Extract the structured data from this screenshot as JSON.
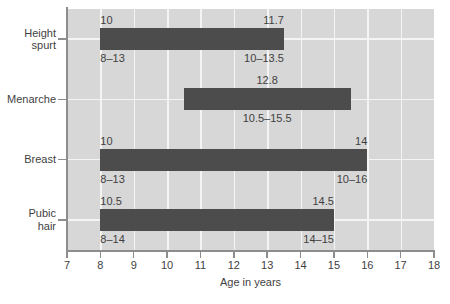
{
  "chart_data": {
    "type": "bar",
    "orientation": "horizontal",
    "title": "",
    "xlabel": "Age in years",
    "ylabel": "",
    "xlim": [
      7,
      18
    ],
    "xticks": [
      "7",
      "8",
      "9",
      "10",
      "11",
      "12",
      "13",
      "14",
      "15",
      "16",
      "17",
      "18"
    ],
    "grid": true,
    "legend": null,
    "categories": [
      "Height spurt",
      "Menarche",
      "Breast",
      "Pubic hair"
    ],
    "bars": [
      {
        "category": "Height spurt",
        "category_label": "Height\nspurt",
        "start": 8,
        "end": 13.5,
        "label_above_left": "10",
        "label_above_right": "11.7",
        "label_below_left": "8–13",
        "label_below_right": "10–13.5"
      },
      {
        "category": "Menarche",
        "category_label": "Menarche",
        "start": 10.5,
        "end": 15.5,
        "label_above_left": "",
        "label_above_center": "12.8",
        "label_above_right": "",
        "label_below_center": "10.5–15.5"
      },
      {
        "category": "Breast",
        "category_label": "Breast",
        "start": 8,
        "end": 16,
        "label_above_left": "10",
        "label_above_right": "14",
        "label_below_left": "8–13",
        "label_below_right": "10–16"
      },
      {
        "category": "Pubic hair",
        "category_label": "Pubic\nhair",
        "start": 8,
        "end": 15,
        "label_above_left": "10.5",
        "label_above_right": "14.5",
        "label_below_left": "8–14",
        "label_below_right": "14–15"
      }
    ],
    "colors": {
      "bar": "#4c4c4c",
      "plot_background": "#d7d7d7",
      "gridline": "#f4f4f4",
      "axis": "#8d8d8d",
      "text": "#3f3f3f",
      "figure_background": "#ffffff"
    }
  }
}
